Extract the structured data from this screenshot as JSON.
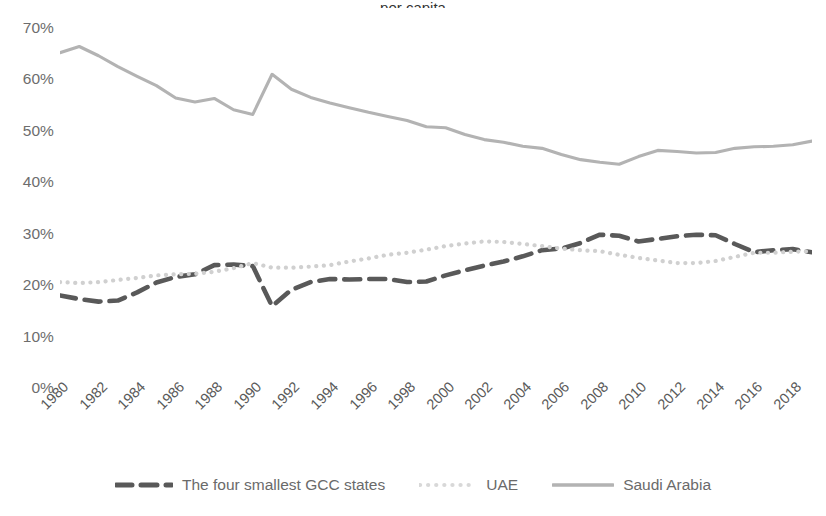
{
  "title_clipped": "…per capita…",
  "chart_data": {
    "type": "line",
    "title": "",
    "xlabel": "",
    "ylabel": "",
    "ylim": [
      0,
      70
    ],
    "xlim": [
      1980,
      2019
    ],
    "grid": false,
    "legend_position": "bottom",
    "y_ticks": [
      "0%",
      "10%",
      "20%",
      "30%",
      "40%",
      "50%",
      "60%",
      "70%"
    ],
    "y_tick_values": [
      0,
      10,
      20,
      30,
      40,
      50,
      60,
      70
    ],
    "x_tick_labels": [
      "1980",
      "1982",
      "1984",
      "1986",
      "1988",
      "1990",
      "1992",
      "1994",
      "1996",
      "1998",
      "2000",
      "2002",
      "2004",
      "2006",
      "2008",
      "2010",
      "2012",
      "2014",
      "2016",
      "2018"
    ],
    "x": [
      1980,
      1981,
      1982,
      1983,
      1984,
      1985,
      1986,
      1987,
      1988,
      1989,
      1990,
      1991,
      1992,
      1993,
      1994,
      1995,
      1996,
      1997,
      1998,
      1999,
      2000,
      2001,
      2002,
      2003,
      2004,
      2005,
      2006,
      2007,
      2008,
      2009,
      2010,
      2011,
      2012,
      2013,
      2014,
      2015,
      2016,
      2017,
      2018,
      2019
    ],
    "series": [
      {
        "name": "The four smallest GCC states",
        "style": "dashed",
        "color": "#595959",
        "values": [
          18.0,
          17.3,
          16.8,
          17.0,
          18.6,
          20.5,
          21.6,
          22.1,
          23.9,
          24.0,
          23.7,
          15.9,
          19.1,
          20.6,
          21.2,
          21.1,
          21.2,
          21.2,
          20.6,
          20.7,
          21.9,
          22.9,
          23.8,
          24.6,
          25.6,
          26.8,
          27.1,
          28.2,
          29.8,
          29.6,
          28.5,
          29.0,
          29.5,
          29.8,
          29.7,
          28.0,
          26.4,
          26.8,
          27.0,
          26.4
        ]
      },
      {
        "name": "UAE",
        "style": "dotted",
        "color": "#d0d0d0",
        "values": [
          20.6,
          20.4,
          20.6,
          21.0,
          21.4,
          21.9,
          22.1,
          22.2,
          22.6,
          23.3,
          24.3,
          23.4,
          23.4,
          23.6,
          23.9,
          24.6,
          25.2,
          25.9,
          26.3,
          26.9,
          27.6,
          28.1,
          28.5,
          28.4,
          28.0,
          27.6,
          27.1,
          26.8,
          26.6,
          25.9,
          25.3,
          24.8,
          24.3,
          24.3,
          24.7,
          25.5,
          26.3,
          26.3,
          26.5,
          26.6
        ]
      },
      {
        "name": "Saudi Arabia",
        "style": "solid",
        "color": "#b3b3b3",
        "values": [
          65.2,
          66.4,
          64.6,
          62.5,
          60.6,
          58.8,
          56.4,
          55.6,
          56.3,
          54.1,
          53.2,
          61.0,
          58.1,
          56.5,
          55.4,
          54.5,
          53.6,
          52.8,
          52.0,
          50.8,
          50.6,
          49.3,
          48.3,
          47.8,
          47.0,
          46.6,
          45.4,
          44.4,
          43.9,
          43.5,
          45.0,
          46.2,
          46.0,
          45.7,
          45.8,
          46.6,
          46.9,
          47.0,
          47.3,
          48.0
        ]
      }
    ]
  },
  "legend": [
    {
      "label": "The four smallest GCC states",
      "icon": "dashed-line-swatch"
    },
    {
      "label": "UAE",
      "icon": "dotted-line-swatch"
    },
    {
      "label": "Saudi Arabia",
      "icon": "solid-line-swatch"
    }
  ]
}
